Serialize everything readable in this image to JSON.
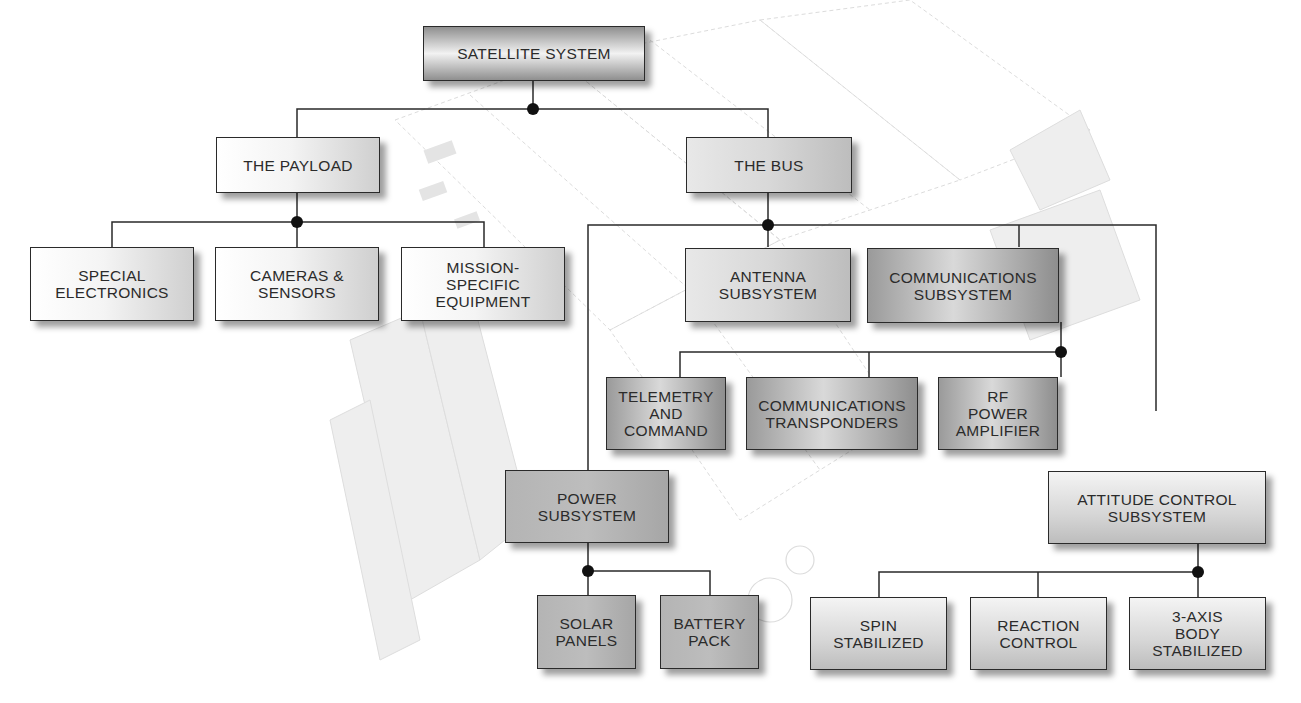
{
  "diagram": {
    "type": "hierarchy",
    "root": "SATELLITE SYSTEM",
    "nodes": {
      "satellite_system": "SATELLITE SYSTEM",
      "payload": "THE PAYLOAD",
      "bus": "THE BUS",
      "special_electronics": "SPECIAL\nELECTRONICS",
      "cameras_sensors": "CAMERAS &\nSENSORS",
      "mission_specific": "MISSION-\nSPECIFIC\nEQUIPMENT",
      "antenna_subsystem": "ANTENNA\nSUBSYSTEM",
      "communications_subsystem": "COMMUNICATIONS\nSUBSYSTEM",
      "telemetry_command": "TELEMETRY\nAND\nCOMMAND",
      "communications_transponders": "COMMUNICATIONS\nTRANSPONDERS",
      "rf_power_amplifier": "RF\nPOWER\nAMPLIFIER",
      "power_subsystem": "POWER\nSUBSYSTEM",
      "solar_panels": "SOLAR\nPANELS",
      "battery_pack": "BATTERY\nPACK",
      "attitude_control_subsystem": "ATTITUDE CONTROL\nSUBSYSTEM",
      "spin_stabilized": "SPIN\nSTABILIZED",
      "reaction_control": "REACTION\nCONTROL",
      "three_axis_body_stabilized": "3-AXIS\nBODY\nSTABILIZED"
    },
    "edges": [
      [
        "SATELLITE SYSTEM",
        "THE PAYLOAD"
      ],
      [
        "SATELLITE SYSTEM",
        "THE BUS"
      ],
      [
        "THE PAYLOAD",
        "SPECIAL ELECTRONICS"
      ],
      [
        "THE PAYLOAD",
        "CAMERAS & SENSORS"
      ],
      [
        "THE PAYLOAD",
        "MISSION-SPECIFIC EQUIPMENT"
      ],
      [
        "THE BUS",
        "ANTENNA SUBSYSTEM"
      ],
      [
        "THE BUS",
        "COMMUNICATIONS SUBSYSTEM"
      ],
      [
        "THE BUS",
        "POWER SUBSYSTEM"
      ],
      [
        "THE BUS",
        "ATTITUDE CONTROL SUBSYSTEM"
      ],
      [
        "COMMUNICATIONS SUBSYSTEM",
        "TELEMETRY AND COMMAND"
      ],
      [
        "COMMUNICATIONS SUBSYSTEM",
        "COMMUNICATIONS TRANSPONDERS"
      ],
      [
        "COMMUNICATIONS SUBSYSTEM",
        "RF POWER AMPLIFIER"
      ],
      [
        "POWER SUBSYSTEM",
        "SOLAR PANELS"
      ],
      [
        "POWER SUBSYSTEM",
        "BATTERY PACK"
      ],
      [
        "ATTITUDE CONTROL SUBSYSTEM",
        "SPIN STABILIZED"
      ],
      [
        "ATTITUDE CONTROL SUBSYSTEM",
        "REACTION CONTROL"
      ],
      [
        "ATTITUDE CONTROL SUBSYSTEM",
        "3-AXIS BODY STABILIZED"
      ]
    ],
    "colors": {
      "line": "#2a2a2a",
      "junction_dot": "#111111",
      "background_art": "#d9d9d9"
    }
  }
}
